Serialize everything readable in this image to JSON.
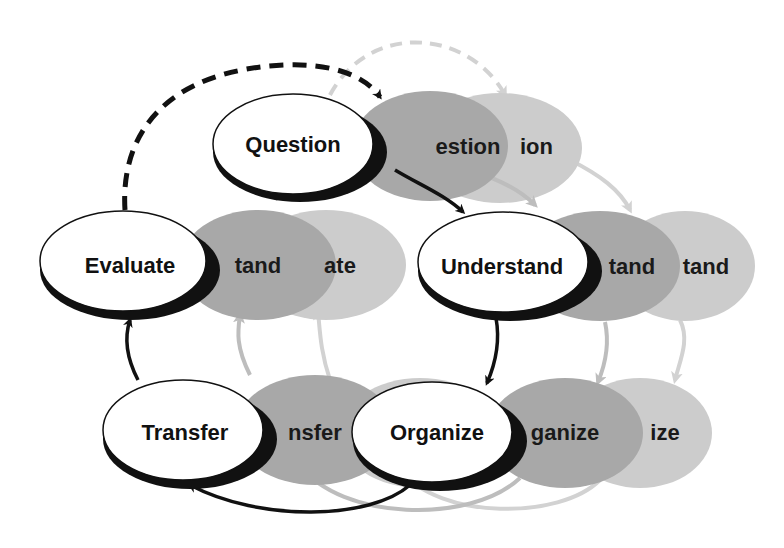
{
  "diagram": {
    "colors": {
      "front_fill": "#ffffff",
      "front_shadow": "#111111",
      "layer2_fill": "#a6a6a6",
      "layer3_fill": "#cccccc",
      "arrow_front": "#111111",
      "arrow_layer2": "#bdbdbd",
      "arrow_layer3": "#d2d2d2"
    },
    "nodes": [
      {
        "id": "question",
        "label": "Question",
        "back2": "estion",
        "back3": "ion"
      },
      {
        "id": "understand",
        "label": "Understand",
        "back2": "tand",
        "back3": "tand"
      },
      {
        "id": "organize",
        "label": "Organize",
        "back2": "ganize",
        "back3": "ize"
      },
      {
        "id": "transfer",
        "label": "Transfer",
        "back2": "nsfer",
        "back3": ""
      },
      {
        "id": "evaluate",
        "label": "Evaluate",
        "back2": "aluate",
        "back3": "ate"
      }
    ],
    "edges": [
      {
        "from": "question",
        "to": "understand",
        "style": "solid"
      },
      {
        "from": "understand",
        "to": "organize",
        "style": "solid"
      },
      {
        "from": "organize",
        "to": "transfer",
        "style": "solid"
      },
      {
        "from": "transfer",
        "to": "evaluate",
        "style": "solid"
      },
      {
        "from": "evaluate",
        "to": "question",
        "style": "dashed"
      }
    ]
  }
}
